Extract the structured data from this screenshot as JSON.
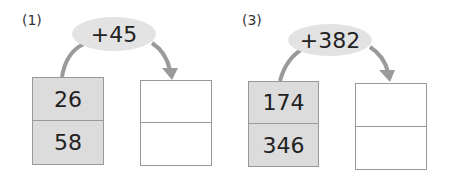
{
  "problems": [
    {
      "label": "(1)",
      "operation": "+45",
      "inputs": [
        "26",
        "58"
      ],
      "outputs": [
        "",
        ""
      ]
    },
    {
      "label": "(3)",
      "operation": "+382",
      "inputs": [
        "174",
        "346"
      ],
      "outputs": [
        "",
        ""
      ]
    }
  ],
  "colors": {
    "ellipse": "#e3e3e3",
    "filled_box": "#dcdcdc",
    "arrow": "#9a9a9a",
    "border": "#999999"
  }
}
